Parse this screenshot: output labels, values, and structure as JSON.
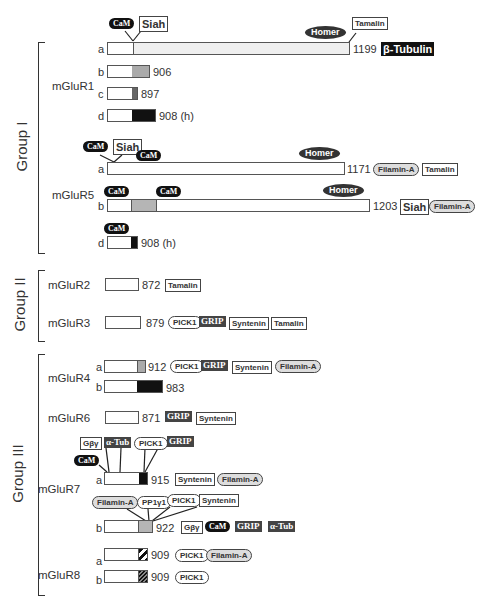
{
  "groups": [
    {
      "label": "Group I"
    },
    {
      "label": "Group II"
    },
    {
      "label": "Group III"
    }
  ],
  "receptors": {
    "mGluR1": {
      "label": "mGluR1",
      "isoforms": [
        {
          "id": "a",
          "length": "1199",
          "partners": [
            "β-Tubulin"
          ],
          "top_partners": [
            "CaM",
            "Siah",
            "Homer",
            "Tamalin"
          ]
        },
        {
          "id": "b",
          "length": "906"
        },
        {
          "id": "c",
          "length": "897"
        },
        {
          "id": "d",
          "length": "908 (h)"
        }
      ]
    },
    "mGluR5": {
      "label": "mGluR5",
      "isoforms": [
        {
          "id": "a",
          "length": "1171",
          "partners": [
            "Filamin-A",
            "Tamalin"
          ],
          "top_partners": [
            "CaM",
            "Siah",
            "CaM",
            "Homer"
          ]
        },
        {
          "id": "b",
          "length": "1203",
          "partners": [
            "Siah",
            "Filamin-A"
          ],
          "top_partners": [
            "CaM",
            "CaM",
            "Homer"
          ]
        },
        {
          "id": "d",
          "length": "908 (h)",
          "top_partners": [
            "CaM"
          ]
        }
      ]
    },
    "mGluR2": {
      "label": "mGluR2",
      "length": "872",
      "partners": [
        "Tamalin"
      ]
    },
    "mGluR3": {
      "label": "mGluR3",
      "length": "879",
      "partners": [
        "PICK1",
        "GRIP",
        "Syntenin",
        "Tamalin"
      ]
    },
    "mGluR4": {
      "label": "mGluR4",
      "isoforms": [
        {
          "id": "a",
          "length": "912",
          "partners": [
            "PICK1",
            "GRIP",
            "Syntenin",
            "Filamin-A"
          ]
        },
        {
          "id": "b",
          "length": "983"
        }
      ]
    },
    "mGluR6": {
      "label": "mGluR6",
      "length": "871",
      "partners": [
        "GRIP",
        "Syntenin"
      ]
    },
    "mGluR7": {
      "label": "mGluR7",
      "isoforms": [
        {
          "id": "a",
          "length": "915",
          "partners": [
            "Syntenin",
            "Filamin-A"
          ],
          "top_partners": [
            "Gβγ",
            "α-Tub",
            "PICK1",
            "GRIP",
            "CaM"
          ]
        },
        {
          "id": "b",
          "length": "922",
          "partners": [
            "Gβγ",
            "CaM",
            "GRIP",
            "α-Tub"
          ],
          "top_partners": [
            "Filamin-A",
            "PP1γ1",
            "PICK1",
            "Syntenin"
          ]
        }
      ]
    },
    "mGluR8": {
      "label": "mGluR8",
      "isoforms": [
        {
          "id": "a",
          "length": "909",
          "partners": [
            "PICK1",
            "Filamin-A"
          ]
        },
        {
          "id": "b",
          "length": "909",
          "partners": [
            "PICK1"
          ]
        }
      ]
    }
  }
}
